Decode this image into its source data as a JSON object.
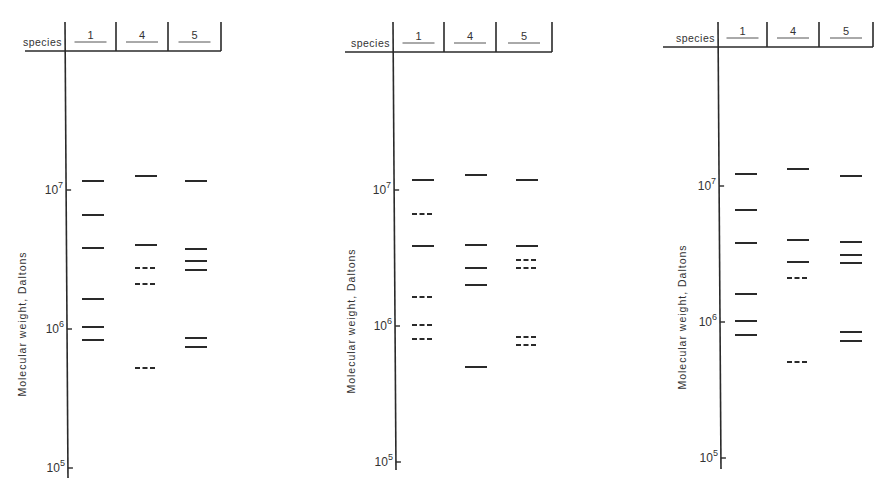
{
  "figure": {
    "header_label": "species",
    "lanes": [
      "1",
      "4",
      "5"
    ],
    "y_axis_label": "Molecular weight, Daltons",
    "ticks": [
      {
        "base": "10",
        "exp": "7"
      },
      {
        "base": "10",
        "exp": "6"
      },
      {
        "base": "10",
        "exp": "5"
      }
    ]
  },
  "chart_data": [
    {
      "type": "gel-band-diagram",
      "panel": "left",
      "ylabel": "Molecular weight, Daltons",
      "yscale": "log",
      "ylim": [
        100000,
        20000000
      ],
      "categories": [
        "1",
        "4",
        "5"
      ],
      "series": [
        {
          "lane": "1",
          "bands": [
            {
              "mw": 11500000,
              "style": "solid"
            },
            {
              "mw": 6500000,
              "style": "solid"
            },
            {
              "mw": 3900000,
              "style": "solid"
            },
            {
              "mw": 1600000,
              "style": "solid"
            },
            {
              "mw": 1000000,
              "style": "solid"
            },
            {
              "mw": 800000,
              "style": "solid"
            }
          ]
        },
        {
          "lane": "4",
          "bands": [
            {
              "mw": 12500000,
              "style": "solid"
            },
            {
              "mw": 4100000,
              "style": "solid"
            },
            {
              "mw": 2700000,
              "style": "dashed"
            },
            {
              "mw": 2100000,
              "style": "dashed"
            },
            {
              "mw": 500000,
              "style": "dashed"
            }
          ]
        },
        {
          "lane": "5",
          "bands": [
            {
              "mw": 11500000,
              "style": "solid"
            },
            {
              "mw": 3800000,
              "style": "solid"
            },
            {
              "mw": 3100000,
              "style": "solid"
            },
            {
              "mw": 2700000,
              "style": "solid"
            },
            {
              "mw": 830000,
              "style": "solid"
            },
            {
              "mw": 720000,
              "style": "solid"
            }
          ]
        }
      ]
    },
    {
      "type": "gel-band-diagram",
      "panel": "middle",
      "ylabel": "Molecular weight, Daltons",
      "yscale": "log",
      "ylim": [
        100000,
        20000000
      ],
      "categories": [
        "1",
        "4",
        "5"
      ],
      "series": [
        {
          "lane": "1",
          "bands": [
            {
              "mw": 11500000,
              "style": "solid"
            },
            {
              "mw": 6500000,
              "style": "dashed"
            },
            {
              "mw": 3800000,
              "style": "solid"
            },
            {
              "mw": 1600000,
              "style": "dashed"
            },
            {
              "mw": 1000000,
              "style": "dashed"
            },
            {
              "mw": 800000,
              "style": "dashed"
            }
          ]
        },
        {
          "lane": "4",
          "bands": [
            {
              "mw": 12500000,
              "style": "solid"
            },
            {
              "mw": 3900000,
              "style": "solid"
            },
            {
              "mw": 2600000,
              "style": "solid"
            },
            {
              "mw": 2000000,
              "style": "solid"
            },
            {
              "mw": 500000,
              "style": "solid"
            }
          ]
        },
        {
          "lane": "5",
          "bands": [
            {
              "mw": 11500000,
              "style": "solid"
            },
            {
              "mw": 3800000,
              "style": "solid"
            },
            {
              "mw": 3000000,
              "style": "dashed"
            },
            {
              "mw": 2600000,
              "style": "dashed"
            },
            {
              "mw": 820000,
              "style": "dashed"
            },
            {
              "mw": 720000,
              "style": "dashed"
            }
          ]
        }
      ]
    },
    {
      "type": "gel-band-diagram",
      "panel": "right",
      "ylabel": "Molecular weight, Daltons",
      "yscale": "log",
      "ylim": [
        100000,
        20000000
      ],
      "categories": [
        "1",
        "4",
        "5"
      ],
      "series": [
        {
          "lane": "1",
          "bands": [
            {
              "mw": 11500000,
              "style": "solid"
            },
            {
              "mw": 6500000,
              "style": "solid"
            },
            {
              "mw": 3800000,
              "style": "solid"
            },
            {
              "mw": 1600000,
              "style": "solid"
            },
            {
              "mw": 1000000,
              "style": "solid"
            },
            {
              "mw": 800000,
              "style": "solid"
            }
          ]
        },
        {
          "lane": "4",
          "bands": [
            {
              "mw": 12500000,
              "style": "solid"
            },
            {
              "mw": 4000000,
              "style": "solid"
            },
            {
              "mw": 2700000,
              "style": "solid"
            },
            {
              "mw": 2100000,
              "style": "dashed"
            },
            {
              "mw": 500000,
              "style": "dashed"
            }
          ]
        },
        {
          "lane": "5",
          "bands": [
            {
              "mw": 11500000,
              "style": "solid"
            },
            {
              "mw": 3800000,
              "style": "solid"
            },
            {
              "mw": 3100000,
              "style": "solid"
            },
            {
              "mw": 2700000,
              "style": "solid"
            },
            {
              "mw": 850000,
              "style": "solid"
            },
            {
              "mw": 730000,
              "style": "solid"
            }
          ]
        }
      ]
    }
  ],
  "panels": [
    {
      "axis_x": 65,
      "header_y": 51,
      "header_top": 22,
      "dividers": [
        116,
        168,
        221
      ],
      "header_left": 25,
      "label_x": 16,
      "ticks_y": [
        190,
        329,
        468
      ],
      "axis_bottom": 478,
      "lane_centers": [
        93,
        146,
        196
      ],
      "bands": [
        [
          {
            "y": 181,
            "d": 0
          },
          {
            "y": 215,
            "d": 0
          },
          {
            "y": 248,
            "d": 0
          },
          {
            "y": 299,
            "d": 0
          },
          {
            "y": 327,
            "d": 0
          },
          {
            "y": 340,
            "d": 0
          }
        ],
        [
          {
            "y": 176,
            "d": 0
          },
          {
            "y": 245,
            "d": 0
          },
          {
            "y": 268,
            "d": 1
          },
          {
            "y": 284,
            "d": 1
          },
          {
            "y": 368,
            "d": 1
          }
        ],
        [
          {
            "y": 181,
            "d": 0
          },
          {
            "y": 249,
            "d": 0
          },
          {
            "y": 261,
            "d": 0
          },
          {
            "y": 270,
            "d": 0
          },
          {
            "y": 338,
            "d": 0
          },
          {
            "y": 347,
            "d": 0
          }
        ]
      ]
    },
    {
      "axis_x": 393,
      "header_y": 52,
      "header_top": 22,
      "dividers": [
        444,
        496,
        552
      ],
      "header_left": 345,
      "label_x": 345,
      "ticks_y": [
        190,
        326,
        462
      ],
      "axis_bottom": 470,
      "lane_centers": [
        423,
        476,
        527
      ],
      "bands": [
        [
          {
            "y": 180,
            "d": 0
          },
          {
            "y": 214,
            "d": 1
          },
          {
            "y": 246,
            "d": 0
          },
          {
            "y": 297,
            "d": 1
          },
          {
            "y": 325,
            "d": 1
          },
          {
            "y": 339,
            "d": 1
          }
        ],
        [
          {
            "y": 175,
            "d": 0
          },
          {
            "y": 245,
            "d": 0
          },
          {
            "y": 268,
            "d": 0
          },
          {
            "y": 285,
            "d": 0
          },
          {
            "y": 367,
            "d": 0
          }
        ],
        [
          {
            "y": 180,
            "d": 0
          },
          {
            "y": 246,
            "d": 0
          },
          {
            "y": 260,
            "d": 1
          },
          {
            "y": 268,
            "d": 1
          },
          {
            "y": 337,
            "d": 1
          },
          {
            "y": 345,
            "d": 1
          }
        ]
      ]
    },
    {
      "axis_x": 718,
      "header_y": 47,
      "header_top": 22,
      "dividers": [
        767,
        819,
        873
      ],
      "header_left": 663,
      "label_x": 676,
      "ticks_y": [
        186,
        322,
        458
      ],
      "axis_bottom": 469,
      "lane_centers": [
        746,
        798,
        851
      ],
      "bands": [
        [
          {
            "y": 174,
            "d": 0
          },
          {
            "y": 210,
            "d": 0
          },
          {
            "y": 243,
            "d": 0
          },
          {
            "y": 294,
            "d": 0
          },
          {
            "y": 321,
            "d": 0
          },
          {
            "y": 335,
            "d": 0
          }
        ],
        [
          {
            "y": 169,
            "d": 0
          },
          {
            "y": 240,
            "d": 0
          },
          {
            "y": 262,
            "d": 0
          },
          {
            "y": 278,
            "d": 1
          },
          {
            "y": 362,
            "d": 1
          }
        ],
        [
          {
            "y": 176,
            "d": 0
          },
          {
            "y": 242,
            "d": 0
          },
          {
            "y": 255,
            "d": 0
          },
          {
            "y": 263,
            "d": 0
          },
          {
            "y": 332,
            "d": 0
          },
          {
            "y": 341,
            "d": 0
          }
        ]
      ]
    }
  ]
}
